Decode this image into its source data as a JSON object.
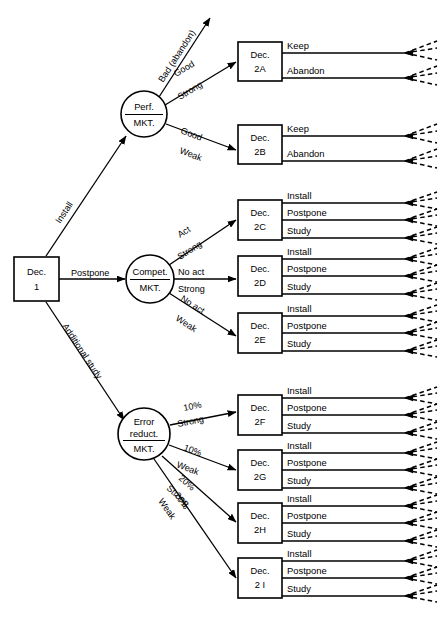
{
  "diagram": {
    "type": "decision-tree",
    "root": {
      "id": "dec-1",
      "shape": "square",
      "line1": "Dec.",
      "line2": "1",
      "branches": [
        "Install",
        "Postpone",
        "Additional study"
      ]
    },
    "chance_nodes": [
      {
        "id": "perf-mkt",
        "shape": "circle",
        "line1": "Perf.",
        "line2": "MKT.",
        "branches": [
          {
            "top": "Bad (abandon)",
            "bottom": "",
            "terminal": "arrow"
          },
          {
            "top": "Good",
            "bottom": "Strong",
            "target": "dec-2a"
          },
          {
            "top": "Good",
            "bottom": "Weak",
            "target": "dec-2b"
          }
        ]
      },
      {
        "id": "compet-mkt",
        "shape": "circle",
        "line1": "Compet.",
        "line2": "MKT.",
        "branches": [
          {
            "top": "Act",
            "bottom": "Strong",
            "target": "dec-2c"
          },
          {
            "top": "No act",
            "bottom": "Strong",
            "target": "dec-2d"
          },
          {
            "top": "No act",
            "bottom": "Weak",
            "target": "dec-2e"
          }
        ]
      },
      {
        "id": "error-reduct-mkt",
        "shape": "circle",
        "line1": "Error",
        "line2": "reduct.",
        "line3": "MKT.",
        "branches": [
          {
            "top": "10%",
            "bottom": "Strong",
            "target": "dec-2f"
          },
          {
            "top": "10%",
            "bottom": "Weak",
            "target": "dec-2g"
          },
          {
            "top": "20%",
            "bottom": "Strong",
            "target": "dec-2h"
          },
          {
            "top": "20%",
            "bottom": "Weak",
            "target": "dec-2i"
          }
        ]
      }
    ],
    "decision_nodes": [
      {
        "id": "dec-2a",
        "line1": "Dec.",
        "line2": "2A",
        "options": [
          "Keep",
          "Abandon"
        ]
      },
      {
        "id": "dec-2b",
        "line1": "Dec.",
        "line2": "2B",
        "options": [
          "Keep",
          "Abandon"
        ]
      },
      {
        "id": "dec-2c",
        "line1": "Dec.",
        "line2": "2C",
        "options": [
          "Install",
          "Postpone",
          "Study"
        ]
      },
      {
        "id": "dec-2d",
        "line1": "Dec.",
        "line2": "2D",
        "options": [
          "Install",
          "Postpone",
          "Study"
        ]
      },
      {
        "id": "dec-2e",
        "line1": "Dec.",
        "line2": "2E",
        "options": [
          "Install",
          "Postpone",
          "Study"
        ]
      },
      {
        "id": "dec-2f",
        "line1": "Dec.",
        "line2": "2F",
        "options": [
          "Install",
          "Postpone",
          "Study"
        ]
      },
      {
        "id": "dec-2g",
        "line1": "Dec.",
        "line2": "2G",
        "options": [
          "Install",
          "Postpone",
          "Study"
        ]
      },
      {
        "id": "dec-2h",
        "line1": "Dec.",
        "line2": "2H",
        "options": [
          "Install",
          "Postpone",
          "Study"
        ]
      },
      {
        "id": "dec-2i",
        "line1": "Dec.",
        "line2": "2 I",
        "options": [
          "Install",
          "Postpone",
          "Study"
        ]
      }
    ],
    "colors": {
      "stroke": "#000000",
      "fill": "#ffffff",
      "background": "#ffffff"
    }
  }
}
